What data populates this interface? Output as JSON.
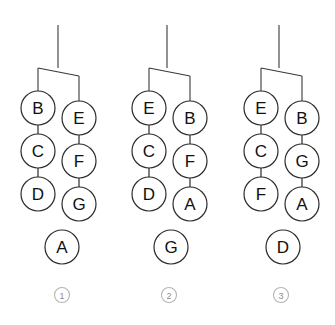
{
  "figure": {
    "background_color": "#ffffff",
    "stroke_color": "#2b2b2b",
    "index_color": "#8c8c8c",
    "node_radius": 17,
    "index_radius": 7.5
  },
  "diagrams": [
    {
      "id": "diagram-1",
      "index_label": "①",
      "index_number": "1",
      "index_cx": 62,
      "index_cy": 295,
      "stem": {
        "x": 58,
        "y_top": 25,
        "y_bottom": 68
      },
      "connector": {
        "left_x": 38,
        "right_x": 79,
        "bar_left_y": 68,
        "bar_right_y": 76,
        "left_drop_y": 91,
        "right_drop_y": 101
      },
      "columns": [
        {
          "name": "left-chain",
          "cx": 38,
          "nodes": [
            {
              "label": "B",
              "cy": 108
            },
            {
              "label": "C",
              "cy": 151
            },
            {
              "label": "D",
              "cy": 194
            }
          ]
        },
        {
          "name": "right-chain",
          "cx": 79,
          "nodes": [
            {
              "label": "E",
              "cy": 118
            },
            {
              "label": "F",
              "cy": 161
            },
            {
              "label": "G",
              "cy": 204
            }
          ]
        }
      ],
      "isolated_node": {
        "label": "A",
        "cx": 62,
        "cy": 247
      }
    },
    {
      "id": "diagram-2",
      "index_label": "②",
      "index_number": "2",
      "index_cx": 169,
      "index_cy": 295,
      "stem": {
        "x": 167,
        "y_top": 25,
        "y_bottom": 68
      },
      "connector": {
        "left_x": 149,
        "right_x": 190,
        "bar_left_y": 68,
        "bar_right_y": 76,
        "left_drop_y": 91,
        "right_drop_y": 101
      },
      "columns": [
        {
          "name": "left-chain",
          "cx": 149,
          "nodes": [
            {
              "label": "E",
              "cy": 108
            },
            {
              "label": "C",
              "cy": 151
            },
            {
              "label": "D",
              "cy": 194
            }
          ]
        },
        {
          "name": "right-chain",
          "cx": 190,
          "nodes": [
            {
              "label": "B",
              "cy": 118
            },
            {
              "label": "F",
              "cy": 161
            },
            {
              "label": "A",
              "cy": 204
            }
          ]
        }
      ],
      "isolated_node": {
        "label": "G",
        "cx": 171,
        "cy": 247
      }
    },
    {
      "id": "diagram-3",
      "index_label": "③",
      "index_number": "3",
      "index_cx": 281,
      "index_cy": 295,
      "stem": {
        "x": 279,
        "y_top": 25,
        "y_bottom": 68
      },
      "connector": {
        "left_x": 261,
        "right_x": 302,
        "bar_left_y": 68,
        "bar_right_y": 76,
        "left_drop_y": 91,
        "right_drop_y": 101
      },
      "columns": [
        {
          "name": "left-chain",
          "cx": 261,
          "nodes": [
            {
              "label": "E",
              "cy": 108
            },
            {
              "label": "C",
              "cy": 151
            },
            {
              "label": "F",
              "cy": 194
            }
          ]
        },
        {
          "name": "right-chain",
          "cx": 302,
          "nodes": [
            {
              "label": "B",
              "cy": 118
            },
            {
              "label": "G",
              "cy": 161
            },
            {
              "label": "A",
              "cy": 204
            }
          ]
        }
      ],
      "isolated_node": {
        "label": "D",
        "cx": 283,
        "cy": 247
      }
    }
  ]
}
